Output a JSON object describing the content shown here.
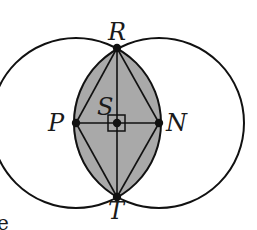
{
  "diagram": {
    "labels": {
      "R": "R",
      "T": "T",
      "P": "P",
      "N": "N",
      "S": "S"
    },
    "stray_text": "e",
    "points": {
      "R": [
        117,
        48
      ],
      "T": [
        117,
        197
      ],
      "P": [
        76,
        123
      ],
      "N": [
        159,
        123
      ],
      "S": [
        117,
        123
      ]
    },
    "circles": [
      {
        "name": "circle-P",
        "center": "P",
        "radius": 85
      },
      {
        "name": "circle-N",
        "center": "N",
        "radius": 85
      }
    ],
    "segments": [
      "RT",
      "PN",
      "PR",
      "RN",
      "NT",
      "TP"
    ],
    "right_angle_marker_at": "S",
    "colors": {
      "stroke": "#111111",
      "shade": "#a9a9a9",
      "background": "#ffffff"
    }
  }
}
